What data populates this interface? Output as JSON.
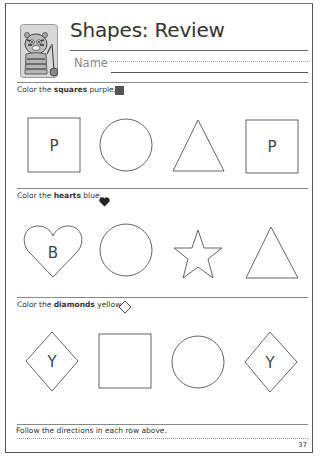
{
  "header": {
    "title": "Shapes: Review",
    "name_label": "Name",
    "mascot_icon": "tiger-mascot-icon"
  },
  "sections": [
    {
      "instruction_prefix": "Color the ",
      "instruction_bold": "squares",
      "instruction_suffix": " purple.",
      "example_icon": "filled-square-icon",
      "color_hint": "#555555",
      "shapes": [
        {
          "type": "square",
          "label": "P"
        },
        {
          "type": "circle",
          "label": ""
        },
        {
          "type": "triangle",
          "label": ""
        },
        {
          "type": "square",
          "label": "P"
        }
      ]
    },
    {
      "instruction_prefix": "Color the ",
      "instruction_bold": "hearts",
      "instruction_suffix": " blue.",
      "example_icon": "filled-heart-icon",
      "color_hint": "#222222",
      "shapes": [
        {
          "type": "heart",
          "label": "B"
        },
        {
          "type": "circle",
          "label": ""
        },
        {
          "type": "star",
          "label": ""
        },
        {
          "type": "triangle",
          "label": ""
        }
      ]
    },
    {
      "instruction_prefix": "Color the ",
      "instruction_bold": "diamonds",
      "instruction_suffix": " yellow.",
      "example_icon": "outline-diamond-icon",
      "color_hint": "#ffffff",
      "shapes": [
        {
          "type": "diamond",
          "label": "Y"
        },
        {
          "type": "square",
          "label": ""
        },
        {
          "type": "circle",
          "label": ""
        },
        {
          "type": "diamond",
          "label": "Y"
        }
      ]
    }
  ],
  "footer": {
    "directions": "Follow the directions in each row above.",
    "page_number": "37"
  }
}
